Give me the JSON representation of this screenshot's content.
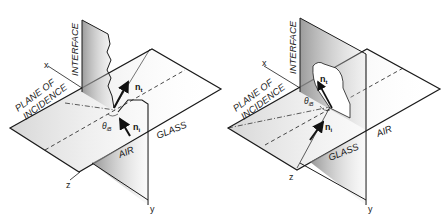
{
  "figure": {
    "panels": [
      {
        "id": "left",
        "labels": {
          "interface": "INTERFACE",
          "plane_line1": "PLANE OF",
          "plane_line2": "INCIDENCE",
          "glass": "GLASS",
          "air": "AIR",
          "axis_x": "x",
          "axis_y": "y",
          "axis_z": "z",
          "vec_t": "n",
          "vec_t_sub": "t",
          "vec_i": "n",
          "vec_i_sub": "i",
          "angle": "θ",
          "angle_sub": "iB"
        }
      },
      {
        "id": "right",
        "labels": {
          "interface": "INTERFACE",
          "plane_line1": "PLANE OF",
          "plane_line2": "INCIDENCE",
          "glass": "GLASS",
          "air": "AIR",
          "axis_x": "x",
          "axis_y": "y",
          "axis_z": "z",
          "vec_t": "n",
          "vec_t_sub": "t",
          "vec_i": "n",
          "vec_i_sub": "i",
          "angle": "θ",
          "angle_sub": "iB"
        }
      }
    ],
    "colors": {
      "line": "#1a1a1a",
      "shade": "#9a9a9a",
      "background": "#ffffff"
    }
  }
}
